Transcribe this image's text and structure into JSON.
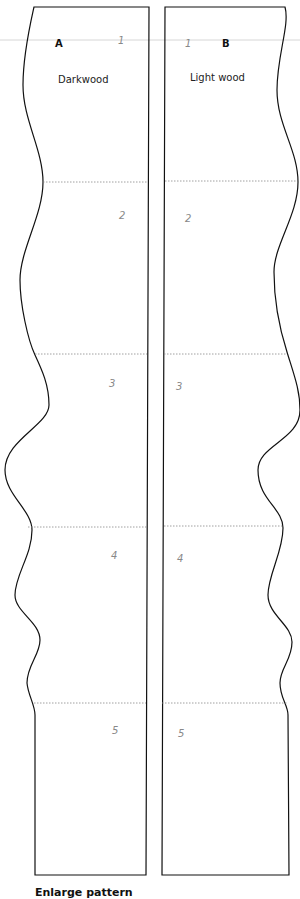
{
  "pieces": [
    {
      "letter": "A",
      "material": "Darkwood",
      "sections": [
        "1",
        "2",
        "3",
        "4",
        "5"
      ]
    },
    {
      "letter": "B",
      "material": "Light wood",
      "sections": [
        "1",
        "2",
        "3",
        "4",
        "5"
      ]
    }
  ],
  "caption": "Enlarge pattern",
  "colors": {
    "outline": "#111111",
    "dotted_divider": "#888888",
    "guide_line": "#cccccc",
    "section_number": "#888888"
  }
}
